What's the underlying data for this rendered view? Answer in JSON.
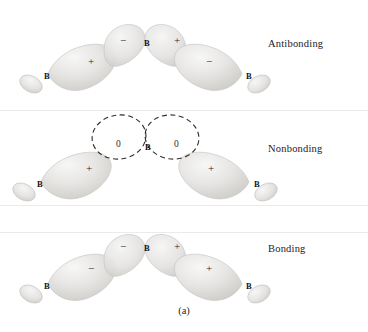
{
  "figure": {
    "caption": "(a)",
    "background_color": "#ffffff",
    "lobe_fill": "#e3e2e0",
    "lobe_outline": "#c9c7c4",
    "dashed_color": "#2f2b2a"
  },
  "rows": [
    {
      "id": "antibonding",
      "label": "Antibonding",
      "label_x": 268,
      "label_y": 38,
      "atoms": [
        {
          "name": "B",
          "x": 44,
          "y": 71
        },
        {
          "name": "B",
          "x": 144,
          "y": 38
        },
        {
          "name": "B",
          "x": 246,
          "y": 71
        }
      ],
      "signs": [
        {
          "symbol": "+",
          "x": 88,
          "y": 55
        },
        {
          "symbol": "−",
          "x": 120,
          "y": 34
        },
        {
          "symbol": "+",
          "x": 174,
          "y": 34
        },
        {
          "symbol": "−",
          "x": 206,
          "y": 55
        }
      ]
    },
    {
      "id": "nonbonding",
      "label": "Nonbonding",
      "label_x": 268,
      "label_y": 143,
      "atoms": [
        {
          "name": "B",
          "x": 37,
          "y": 179
        },
        {
          "name": "B",
          "x": 145,
          "y": 142
        },
        {
          "name": "B",
          "x": 254,
          "y": 179
        }
      ],
      "signs": [
        {
          "symbol": "+",
          "x": 86,
          "y": 162
        },
        {
          "symbol": "+",
          "x": 208,
          "y": 162
        }
      ],
      "zeros": [
        {
          "symbol": "0",
          "x": 116,
          "y": 139
        },
        {
          "symbol": "0",
          "x": 174,
          "y": 139
        }
      ]
    },
    {
      "id": "bonding",
      "label": "Bonding",
      "label_x": 268,
      "label_y": 243,
      "atoms": [
        {
          "name": "B",
          "x": 44,
          "y": 281
        },
        {
          "name": "B",
          "x": 144,
          "y": 243
        },
        {
          "name": "B",
          "x": 246,
          "y": 281
        }
      ],
      "signs": [
        {
          "symbol": "−",
          "x": 88,
          "y": 262
        },
        {
          "symbol": "−",
          "x": 120,
          "y": 240
        },
        {
          "symbol": "+",
          "x": 174,
          "y": 240
        },
        {
          "symbol": "+",
          "x": 206,
          "y": 262
        }
      ]
    }
  ],
  "separators": [
    {
      "y": 110
    },
    {
      "y": 205
    },
    {
      "y": 232
    }
  ]
}
